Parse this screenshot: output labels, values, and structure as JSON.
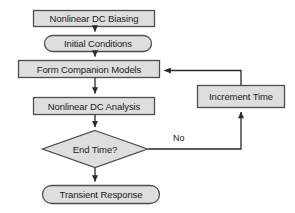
{
  "diagram": {
    "background_color": "#ffffff",
    "shape_fill": "#dedede",
    "shape_stroke": "#4d4d4d",
    "connector_color": "#3a3a3a",
    "text_color": "#1a1a1a",
    "nodes": [
      {
        "id": "nonlinear-dc-biasing",
        "label": "Nonlinear DC Biasing",
        "shape": "rectangle",
        "x": 33,
        "y": 10,
        "w": 122,
        "h": 17
      },
      {
        "id": "initial-conditions",
        "label": "Initial Conditions",
        "shape": "rounded-terminator",
        "x": 44,
        "y": 35,
        "w": 108,
        "h": 17
      },
      {
        "id": "form-companion-models",
        "label": "Form Companion Models",
        "shape": "rectangle",
        "x": 18,
        "y": 60,
        "w": 142,
        "h": 18
      },
      {
        "id": "nonlinear-dc-analysis",
        "label": "Nonlinear DC Analysis",
        "shape": "rectangle",
        "x": 33,
        "y": 97,
        "w": 122,
        "h": 18
      },
      {
        "id": "end-time-decision",
        "label": "End Time?",
        "shape": "diamond",
        "x": 42,
        "y": 130,
        "w": 106,
        "h": 38
      },
      {
        "id": "transient-response",
        "label": "Transient Response",
        "shape": "rounded-terminator",
        "x": 42,
        "y": 185,
        "w": 118,
        "h": 19
      },
      {
        "id": "increment-time",
        "label": "Increment Time",
        "shape": "rectangle",
        "x": 197,
        "y": 85,
        "w": 88,
        "h": 23
      }
    ],
    "edge_labels": [
      {
        "id": "no-branch-label",
        "label": "No",
        "x": 173,
        "y": 133
      }
    ],
    "edges": [
      {
        "from": "nonlinear-dc-biasing",
        "to": "initial-conditions",
        "arrow": true
      },
      {
        "from": "initial-conditions",
        "to": "form-companion-models",
        "arrow": true
      },
      {
        "from": "form-companion-models",
        "to": "nonlinear-dc-analysis",
        "arrow": true
      },
      {
        "from": "nonlinear-dc-analysis",
        "to": "end-time-decision",
        "arrow": true
      },
      {
        "from": "end-time-decision",
        "to": "transient-response",
        "arrow": true
      },
      {
        "from": "end-time-decision",
        "to": "increment-time",
        "arrow": true,
        "label": "No"
      },
      {
        "from": "increment-time",
        "to": "form-companion-models",
        "arrow": true
      }
    ]
  }
}
